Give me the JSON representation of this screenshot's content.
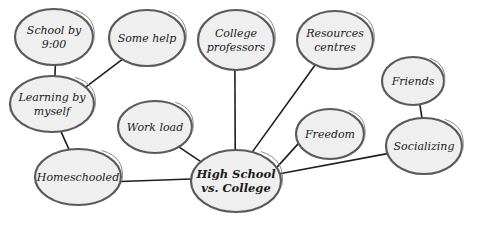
{
  "diagram": {
    "colors": {
      "bubble_fill": "#efefef",
      "bubble_stroke": "#5a5a5a",
      "edge": "#1e1e1e",
      "text": "#1a1a1a"
    },
    "nodes": [
      {
        "id": "center",
        "lines": [
          "High School",
          "vs. College"
        ],
        "cx": 236,
        "cy": 181,
        "rx": 45,
        "ry": 31,
        "main": true
      },
      {
        "id": "school-by-900",
        "lines": [
          "School by",
          "9:00"
        ],
        "cx": 54,
        "cy": 37,
        "rx": 39,
        "ry": 28
      },
      {
        "id": "some-help",
        "lines": [
          "Some help"
        ],
        "cx": 147,
        "cy": 38,
        "rx": 38,
        "ry": 28
      },
      {
        "id": "college-professors",
        "lines": [
          "College",
          "professors"
        ],
        "cx": 236,
        "cy": 40,
        "rx": 38,
        "ry": 30
      },
      {
        "id": "resources-centres",
        "lines": [
          "Resources",
          "centres"
        ],
        "cx": 335,
        "cy": 40,
        "rx": 38,
        "ry": 29
      },
      {
        "id": "friends",
        "lines": [
          "Friends"
        ],
        "cx": 413,
        "cy": 81,
        "rx": 31,
        "ry": 24
      },
      {
        "id": "learning-by-myself",
        "lines": [
          "Learning by",
          "myself"
        ],
        "cx": 52,
        "cy": 104,
        "rx": 42,
        "ry": 28
      },
      {
        "id": "work-load",
        "lines": [
          "Work load"
        ],
        "cx": 155,
        "cy": 127,
        "rx": 37,
        "ry": 26
      },
      {
        "id": "freedom",
        "lines": [
          "Freedom"
        ],
        "cx": 330,
        "cy": 134,
        "rx": 34,
        "ry": 25
      },
      {
        "id": "socializing",
        "lines": [
          "Socializing"
        ],
        "cx": 424,
        "cy": 146,
        "rx": 38,
        "ry": 28
      },
      {
        "id": "homeschooled",
        "lines": [
          "Homeschooled"
        ],
        "cx": 78,
        "cy": 177,
        "rx": 43,
        "ry": 28
      }
    ],
    "edges": [
      {
        "from": "school-by-900",
        "to": "learning-by-myself",
        "x1": 56,
        "y1": 65,
        "x2": 56,
        "y2": 77
      },
      {
        "from": "some-help",
        "to": "learning-by-myself",
        "x1": 134,
        "y1": 63,
        "x2": 88,
        "y2": 89
      },
      {
        "from": "learning-by-myself",
        "to": "homeschooled",
        "x1": 63,
        "y1": 131,
        "x2": 67,
        "y2": 150
      },
      {
        "from": "homeschooled",
        "to": "center",
        "x1": 122,
        "y1": 176,
        "x2": 192,
        "y2": 189
      },
      {
        "from": "work-load",
        "to": "center",
        "x1": 156,
        "y1": 137,
        "x2": 198,
        "y2": 163
      },
      {
        "from": "college-professors",
        "to": "center",
        "x1": 233,
        "y1": 70,
        "x2": 232,
        "y2": 150
      },
      {
        "from": "resources-centres",
        "to": "center",
        "x1": 305,
        "y1": 58,
        "x2": 247,
        "y2": 151
      },
      {
        "from": "freedom",
        "to": "center",
        "x1": 312,
        "y1": 156,
        "x2": 256,
        "y2": 156
      },
      {
        "from": "friends",
        "to": "socializing",
        "x1": 421,
        "y1": 104,
        "x2": 424,
        "y2": 119
      },
      {
        "from": "socializing",
        "to": "center",
        "x1": 388,
        "y1": 156,
        "x2": 279,
        "y2": 176
      }
    ]
  }
}
